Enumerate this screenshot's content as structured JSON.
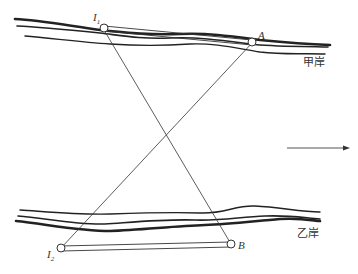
{
  "diagram": {
    "points": {
      "I1": {
        "label": "I",
        "sub": "1"
      },
      "A": {
        "label": "A"
      },
      "I2": {
        "label": "I",
        "sub": "2"
      },
      "B": {
        "label": "B"
      }
    },
    "banks": {
      "upper": "甲岸",
      "lower": "乙岸"
    },
    "flow_direction": "right",
    "colors": {
      "line": "#333333",
      "background": "#ffffff"
    }
  }
}
